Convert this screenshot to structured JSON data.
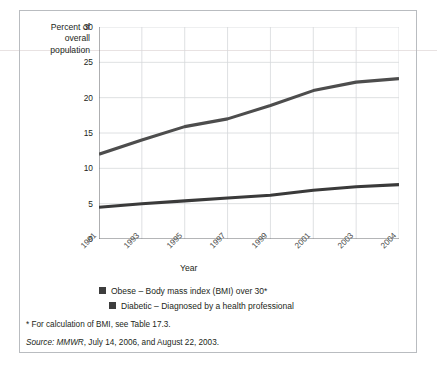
{
  "figure": {
    "y_axis_title": "Percent of\noverall\npopulation",
    "x_axis_title": "Year"
  },
  "legend": {
    "items": [
      {
        "label": "Obese – Body mass index (BMI) over 30*",
        "color": "#3d3d3d"
      },
      {
        "label": "Diabetic – Diagnosed by a health professional",
        "color": "#3d3d3d"
      }
    ]
  },
  "notes": {
    "footnote": "* For calculation of BMI, see Table 17.3.",
    "source_prefix": "Source:",
    "source_italic": "MMWR",
    "source_rest": ", July 14, 2006, and August 22, 2003."
  },
  "chart_data": {
    "type": "line",
    "title": "",
    "xlabel": "Year",
    "ylabel": "Percent of overall population",
    "x": [
      1991,
      1993,
      1995,
      1997,
      1999,
      2001,
      2003,
      2004
    ],
    "xtick_labels": [
      "1991",
      "1993",
      "1995",
      "1997",
      "1999",
      "2001",
      "2003",
      "2004"
    ],
    "ytick_labels": [
      "0",
      "5",
      "10",
      "15",
      "20",
      "25",
      "30"
    ],
    "yticks": [
      0,
      5,
      10,
      15,
      20,
      25,
      30
    ],
    "ylim": [
      0,
      30
    ],
    "grid": true,
    "legend_position": "below",
    "series": [
      {
        "name": "Obese – Body mass index (BMI) over 30*",
        "color": "#4d4d4d",
        "values": [
          12.0,
          14.0,
          15.9,
          17.0,
          18.9,
          21.0,
          22.2,
          22.7
        ]
      },
      {
        "name": "Diabetic – Diagnosed by a health professional",
        "color": "#3a3a3a",
        "values": [
          4.5,
          5.0,
          5.4,
          5.8,
          6.2,
          6.9,
          7.4,
          7.7
        ]
      }
    ]
  }
}
